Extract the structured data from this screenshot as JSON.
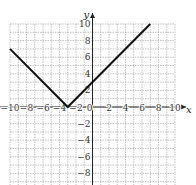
{
  "chart_data": {
    "type": "line",
    "title": "",
    "function": "y = |x + 3|",
    "xlabel": "x",
    "ylabel": "y",
    "xlim": [
      -10,
      10
    ],
    "ylim": [
      -10,
      10
    ],
    "grid": true,
    "x_ticks": [
      -10,
      -8,
      -6,
      -4,
      -2,
      0,
      2,
      4,
      6,
      8,
      10
    ],
    "y_ticks": [
      -8,
      -6,
      -4,
      -2,
      2,
      4,
      6,
      8,
      10
    ],
    "x_tick_labels": [
      "−10",
      "−8",
      "−6",
      "−4",
      "−2",
      "0",
      "2",
      "4",
      "6",
      "8",
      "10"
    ],
    "y_tick_labels": [
      "−8",
      "−6",
      "−4",
      "−2",
      "2",
      "4",
      "6",
      "8",
      "10"
    ],
    "series": [
      {
        "name": "|x+3|",
        "x": [
          -10,
          -3,
          7
        ],
        "y": [
          7,
          0,
          10
        ]
      }
    ]
  }
}
